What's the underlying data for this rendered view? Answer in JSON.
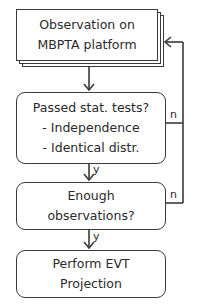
{
  "diagram": {
    "type": "flowchart",
    "nodes": [
      {
        "id": "observation",
        "shape": "multi-document",
        "lines": [
          "Observation on",
          "MBPTA platform"
        ]
      },
      {
        "id": "stat-tests",
        "shape": "rounded-rect",
        "lines": [
          "Passed stat. tests?",
          "- Independence",
          "- Identical distr."
        ]
      },
      {
        "id": "enough-obs",
        "shape": "rounded-rect",
        "lines": [
          "Enough",
          "observations?"
        ]
      },
      {
        "id": "evt",
        "shape": "rounded-rect",
        "lines": [
          "Perform EVT",
          "Projection"
        ]
      }
    ],
    "edges": [
      {
        "from": "observation",
        "to": "stat-tests",
        "label": ""
      },
      {
        "from": "stat-tests",
        "to": "enough-obs",
        "label": "y"
      },
      {
        "from": "enough-obs",
        "to": "evt",
        "label": "y"
      },
      {
        "from": "stat-tests",
        "to": "observation",
        "label": "n"
      },
      {
        "from": "enough-obs",
        "to": "observation",
        "label": "n"
      }
    ],
    "labels": {
      "yes": "y",
      "no": "n"
    },
    "colors": {
      "stroke": "#3a3a3a",
      "text": "#2a2a2a",
      "background": "#ffffff"
    }
  }
}
